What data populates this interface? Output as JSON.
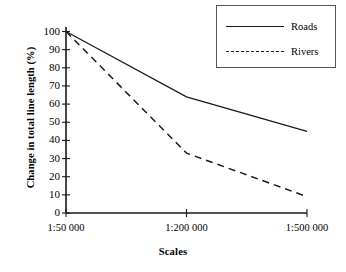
{
  "chart_data": {
    "type": "line",
    "title": "",
    "xlabel": "Scales",
    "ylabel": "Change in total line length (%)",
    "categories": [
      "1:50 000",
      "1:200 000",
      "1:500 000"
    ],
    "series": [
      {
        "name": "Roads",
        "values": [
          100,
          64,
          45
        ],
        "style": "solid"
      },
      {
        "name": "Rivers",
        "values": [
          100,
          33,
          9
        ],
        "style": "dashed"
      }
    ],
    "ylim": [
      0,
      100
    ],
    "yticks": [
      100,
      90,
      80,
      70,
      60,
      50,
      40,
      30,
      20,
      10,
      0
    ],
    "grid": false,
    "legend_position": "top-right",
    "line_color": "#1a1a1a"
  },
  "legend": {
    "entries": [
      {
        "label": "Roads",
        "style": "solid"
      },
      {
        "label": "Rivers",
        "style": "dashed"
      }
    ]
  }
}
